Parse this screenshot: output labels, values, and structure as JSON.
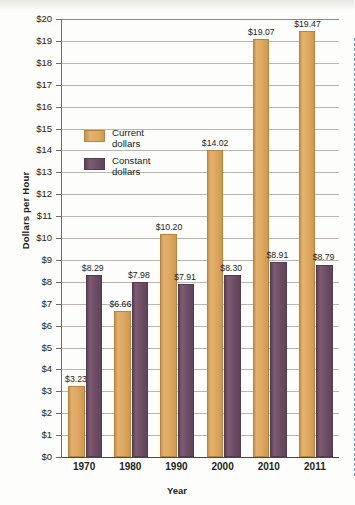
{
  "chart_data": {
    "type": "bar",
    "title": "",
    "xlabel": "Year",
    "ylabel": "Dollars per Hour",
    "categories": [
      "1970",
      "1980",
      "1990",
      "2000",
      "2010",
      "2011"
    ],
    "series": [
      {
        "name": "Current dollars",
        "color": "#dfa961",
        "values": [
          3.23,
          6.66,
          10.2,
          14.02,
          19.07,
          19.47
        ],
        "labels": [
          "$3.23",
          "$6.66",
          "$10.20",
          "$14.02",
          "$19.07",
          "$19.47"
        ]
      },
      {
        "name": "Constant dollars",
        "color": "#6e4d65",
        "values": [
          8.29,
          7.98,
          7.91,
          8.3,
          8.91,
          8.79
        ],
        "labels": [
          "$8.29",
          "$7.98",
          "$7.91",
          "$8.30",
          "$8.91",
          "$8.79"
        ]
      }
    ],
    "ylim": [
      0,
      20
    ],
    "ytick_step": 1,
    "ytick_labels": [
      "$20",
      "$19",
      "$18",
      "$17",
      "$16",
      "$15",
      "$14",
      "$13",
      "$12",
      "$11",
      "$10",
      "$9",
      "$8",
      "$7",
      "$6",
      "$5",
      "$4",
      "$3",
      "$2",
      "$1",
      "$0"
    ],
    "grid": true,
    "legend_position": "inside-upper-left",
    "annotations": [
      {
        "type": "vertical-dashed-line",
        "between": [
          "2010",
          "2011"
        ],
        "color": "#7d98a0"
      }
    ]
  },
  "legend": {
    "items": [
      {
        "label_line1": "Current",
        "label_line2": "dollars"
      },
      {
        "label_line1": "Constant",
        "label_line2": "dollars"
      }
    ]
  }
}
